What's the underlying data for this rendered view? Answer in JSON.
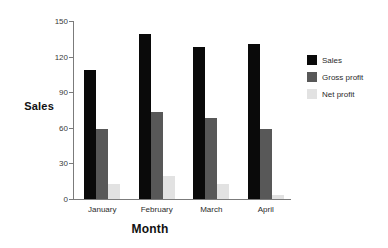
{
  "chart_data": {
    "type": "bar",
    "title": "",
    "xlabel": "Month",
    "ylabel": "Sales",
    "categories": [
      "January",
      "February",
      "March",
      "April"
    ],
    "series": [
      {
        "name": "Sales",
        "color": "#0a0a0a",
        "values": [
          109,
          139,
          128,
          131
        ]
      },
      {
        "name": "Gross profit",
        "color": "#585858",
        "values": [
          59,
          73,
          68,
          59
        ]
      },
      {
        "name": "Net profit",
        "color": "#e2e2e2",
        "values": [
          13,
          19,
          13,
          3
        ]
      }
    ],
    "ylim": [
      0,
      150
    ],
    "yticks": [
      0,
      30,
      60,
      90,
      120,
      150
    ],
    "grid": false,
    "legend_position": "right"
  },
  "axes": {
    "y_title": "Sales",
    "x_title": "Month"
  },
  "legend": {
    "entries": [
      {
        "label": "Sales",
        "color": "#0a0a0a"
      },
      {
        "label": "Gross profit",
        "color": "#585858"
      },
      {
        "label": "Net profit",
        "color": "#e2e2e2"
      }
    ]
  }
}
